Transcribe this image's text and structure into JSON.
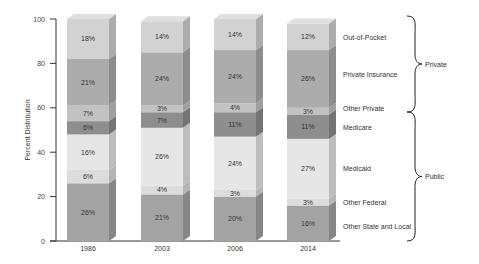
{
  "chart_data": {
    "type": "bar",
    "stacked": true,
    "title": "",
    "xlabel": "",
    "ylabel": "Percent Distribution",
    "ylim": [
      0,
      100
    ],
    "yticks": [
      0,
      20,
      40,
      60,
      80,
      100
    ],
    "grid": false,
    "categories": [
      "1986",
      "2003",
      "2006",
      "2014"
    ],
    "series": [
      {
        "name": "Other State and Local",
        "group": "Public",
        "color": "#a3a3a3",
        "values": [
          26,
          21,
          20,
          16
        ]
      },
      {
        "name": "Other Federal",
        "group": "Public",
        "color": "#dcdcdc",
        "values": [
          6,
          4,
          3,
          3
        ]
      },
      {
        "name": "Medicaid",
        "group": "Public",
        "color": "#e6e6e6",
        "values": [
          16,
          26,
          24,
          27
        ]
      },
      {
        "name": "Medicare",
        "group": "Public",
        "color": "#8e8e8e",
        "values": [
          6,
          7,
          11,
          11
        ]
      },
      {
        "name": "Other Private",
        "group": "Private",
        "color": "#c2c2c2",
        "values": [
          7,
          3,
          4,
          3
        ]
      },
      {
        "name": "Private Insurance",
        "group": "Private",
        "color": "#acacac",
        "values": [
          21,
          24,
          24,
          26
        ]
      },
      {
        "name": "Out-of-Pocket",
        "group": "Private",
        "color": "#d2d2d2",
        "values": [
          18,
          14,
          14,
          12
        ]
      }
    ],
    "legend_position": "right",
    "groups": [
      {
        "name": "Private",
        "members": [
          "Out-of-Pocket",
          "Private Insurance",
          "Other Private"
        ]
      },
      {
        "name": "Public",
        "members": [
          "Medicare",
          "Medicaid",
          "Other Federal",
          "Other State and Local"
        ]
      }
    ]
  }
}
